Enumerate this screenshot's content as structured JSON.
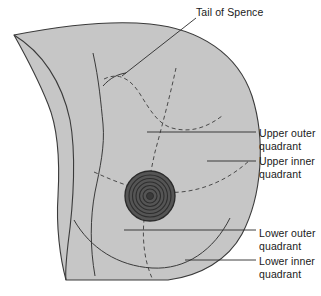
{
  "figure": {
    "type": "anatomical-diagram",
    "canvas": {
      "width": 321,
      "height": 296
    },
    "colors": {
      "background": "#ffffff",
      "breast_fill": "#c6c6c6",
      "outline_stroke": "#3a3a3a",
      "dashed_stroke": "#4a4a4a",
      "leader_stroke": "#2b2b2b",
      "nipple_fill": "#555555",
      "nipple_ring": "#2e2e2e",
      "text": "#1a1a1a"
    },
    "labels": {
      "tail_of_spence": "Tail of Spence",
      "upper_outer_quadrant": "Upper outer\nquadrant",
      "upper_inner_quadrant": "Upper inner\nquadrant",
      "lower_outer_quadrant": "Lower outer\nquadrant",
      "lower_inner_quadrant": "Lower inner\nquadrant"
    },
    "features": {
      "nipple_areola": "nipple-areola-complex",
      "quadrant_dividers": "dashed-vertical-and-horizontal",
      "inframammary_fold": "solid-curve",
      "chest_wall_line": "solid-curve"
    }
  }
}
